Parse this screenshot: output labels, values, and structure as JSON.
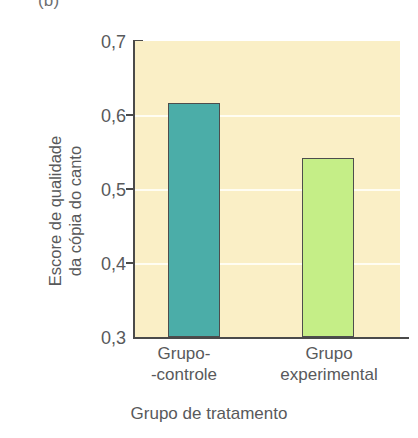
{
  "figure": {
    "panel_letter": "(b)"
  },
  "chart_data": {
    "type": "bar",
    "title": "",
    "subtitle": "",
    "xlabel": "Grupo de tratamento",
    "ylabel": "Escore de qualidade da cópia do canto",
    "ylabel_lines": [
      "Escore de qualidade",
      "da cópia do canto"
    ],
    "categories": [
      "Grupo-controle",
      "Grupo experimental"
    ],
    "category_label_lines": [
      [
        "Grupo-",
        "-controle"
      ],
      [
        "Grupo",
        "experimental"
      ]
    ],
    "values": [
      0.616,
      0.542
    ],
    "ylim": [
      0.3,
      0.7
    ],
    "ytick_values": [
      0.7,
      0.6,
      0.5,
      0.4,
      0.3
    ],
    "ytick_labels": [
      "0,7",
      "0,6",
      "0,5",
      "0,4",
      "0,3"
    ],
    "gridlines": [
      0.6,
      0.5,
      0.4
    ],
    "grid": true,
    "legend": null,
    "legend_position": "none",
    "decimal_separator": ",",
    "bar_colors": [
      "#4bada8",
      "#c5ee87"
    ],
    "bar_edge_color": "#4d4d4d",
    "plot_background": "#faefc6",
    "gridline_color": "#fffdf2",
    "axis_color": "#4a4a4a",
    "text_color": "#58595b"
  }
}
